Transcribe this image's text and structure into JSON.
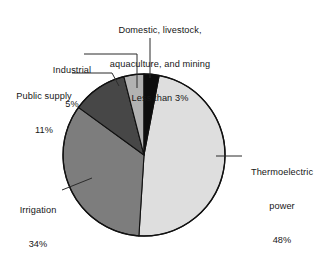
{
  "chart_data": {
    "type": "pie",
    "title": "",
    "subtitle": "",
    "xlabel": "",
    "ylabel": "",
    "legend_position": "none",
    "grid": false,
    "units": "percent of total water withdrawals",
    "start_angle_deg": 0,
    "direction": "clockwise",
    "categories": [
      "Domestic, livestock, aquaculture, and mining",
      "Thermoelectric power",
      "Irrigation",
      "Public supply",
      "Industrial"
    ],
    "values": [
      3,
      48,
      34,
      11,
      5
    ],
    "value_labels": [
      "Less than 3%",
      "48%",
      "34%",
      "11%",
      "5%"
    ],
    "slices": [
      {
        "name": "Domestic, livestock, aquaculture, and mining",
        "label_line1": "Domestic, livestock,",
        "label_line2": "aquaculture, and mining",
        "value_label": "Less than 3%",
        "value": 3,
        "color": "#0d0d0d",
        "start_deg": 0,
        "end_deg": 10.8
      },
      {
        "name": "Thermoelectric power",
        "label_line1": "Thermoelectric",
        "label_line2": "power",
        "value_label": "48%",
        "value": 48,
        "color": "#dedede",
        "start_deg": 10.8,
        "end_deg": 183.6
      },
      {
        "name": "Irrigation",
        "label_line1": "Irrigation",
        "label_line2": "",
        "value_label": "34%",
        "value": 34,
        "color": "#7d7d7d",
        "start_deg": 183.6,
        "end_deg": 306.0
      },
      {
        "name": "Public supply",
        "label_line1": "Public supply",
        "label_line2": "",
        "value_label": "11%",
        "value": 11,
        "color": "#474747",
        "start_deg": 306.0,
        "end_deg": 345.6
      },
      {
        "name": "Industrial",
        "label_line1": "Industrial",
        "label_line2": "",
        "value_label": "5%",
        "value": 5,
        "color": "#b2b2b2",
        "start_deg": 345.6,
        "end_deg": 360.0
      }
    ],
    "colors": {
      "domestic": "#0d0d0d",
      "thermoelectric": "#dedede",
      "irrigation": "#7d7d7d",
      "public_supply": "#474747",
      "industrial": "#b2b2b2",
      "outline": "#111111",
      "leader_line": "#2b2b2b",
      "background": "#ffffff",
      "text": "#161616"
    },
    "geometry": {
      "center_x": 144,
      "center_y": 155,
      "radius": 81
    }
  },
  "labels": {
    "domestic": {
      "line1": "Domestic, livestock,",
      "line2": "aquaculture, and mining",
      "line3": "Less than 3%"
    },
    "industrial": {
      "line1": "Industrial",
      "line2": "5%"
    },
    "public_supply": {
      "line1": "Public supply",
      "line2": "11%"
    },
    "irrigation": {
      "line1": "Irrigation",
      "line2": "34%"
    },
    "thermoelectric": {
      "line1": "Thermoelectric",
      "line2": "power",
      "line3": "48%"
    }
  }
}
